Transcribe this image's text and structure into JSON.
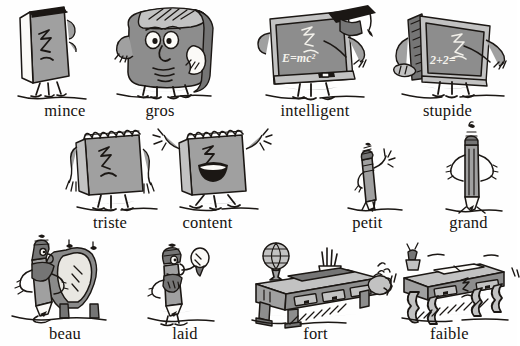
{
  "page": {
    "language": "fr",
    "background_color": "#ffffff",
    "ink_color": "#1b1714",
    "shade_color": "#a0a0a0",
    "rows": 3,
    "columns": 4
  },
  "items": [
    {
      "id": "mince",
      "label": "mince",
      "subject": "book-thin",
      "row": 1,
      "col": 1,
      "x": 0,
      "y": 0,
      "w": 130,
      "h": 120,
      "label_x": 46,
      "label_y": 101,
      "art_x": 12,
      "art_y": 4,
      "art_w": 72,
      "art_h": 92
    },
    {
      "id": "gros",
      "label": "gros",
      "subject": "book-fat",
      "row": 1,
      "col": 2,
      "x": 95,
      "y": 0,
      "w": 130,
      "h": 120,
      "label_x": 71,
      "label_y": 101,
      "art_x": 10,
      "art_y": 2,
      "art_w": 112,
      "art_h": 94
    },
    {
      "id": "intelligent",
      "label": "intelligent",
      "subject": "blackboard-smart",
      "board_text": "E=mc²",
      "row": 1,
      "col": 3,
      "x": 250,
      "y": 0,
      "w": 130,
      "h": 120,
      "label_x": 63,
      "label_y": 101,
      "art_x": 6,
      "art_y": 3,
      "art_w": 118,
      "art_h": 94
    },
    {
      "id": "stupide",
      "label": "stupide",
      "subject": "blackboard-dumb",
      "board_text": "2+2=",
      "row": 1,
      "col": 4,
      "x": 378,
      "y": 0,
      "w": 139,
      "h": 120,
      "label_x": 74,
      "label_y": 101,
      "art_x": 4,
      "art_y": 4,
      "art_w": 122,
      "art_h": 92
    },
    {
      "id": "triste",
      "label": "triste",
      "subject": "notepad-sad",
      "row": 2,
      "col": 1,
      "x": 45,
      "y": 118,
      "w": 130,
      "h": 115,
      "label_x": 48,
      "label_y": 95,
      "art_x": 14,
      "art_y": 3,
      "art_w": 98,
      "art_h": 90
    },
    {
      "id": "content",
      "label": "content",
      "subject": "notepad-happy",
      "row": 2,
      "col": 2,
      "x": 140,
      "y": 118,
      "w": 135,
      "h": 115,
      "label_x": 68,
      "label_y": 95,
      "art_x": 10,
      "art_y": 3,
      "art_w": 112,
      "art_h": 90
    },
    {
      "id": "petit",
      "label": "petit",
      "subject": "pencil-short",
      "row": 2,
      "col": 3,
      "x": 320,
      "y": 118,
      "w": 95,
      "h": 115,
      "label_x": 53,
      "label_y": 95,
      "art_x": 24,
      "art_y": 24,
      "art_w": 58,
      "art_h": 70
    },
    {
      "id": "grand",
      "label": "grand",
      "subject": "pencil-tall",
      "row": 2,
      "col": 4,
      "x": 420,
      "y": 118,
      "w": 97,
      "h": 115,
      "label_x": 53,
      "label_y": 95,
      "art_x": 18,
      "art_y": 3,
      "art_w": 66,
      "art_h": 92
    },
    {
      "id": "beau",
      "label": "beau",
      "subject": "pen-handsome-mirror",
      "row": 3,
      "col": 1,
      "x": 0,
      "y": 232,
      "w": 130,
      "h": 114,
      "label_x": 60,
      "label_y": 92,
      "art_x": 10,
      "art_y": 2,
      "art_w": 94,
      "art_h": 88
    },
    {
      "id": "laid",
      "label": "laid",
      "subject": "pen-ugly-mirror",
      "row": 3,
      "col": 2,
      "x": 120,
      "y": 232,
      "w": 130,
      "h": 114,
      "label_x": 56,
      "label_y": 92,
      "art_x": 24,
      "art_y": 10,
      "art_w": 68,
      "art_h": 80
    },
    {
      "id": "fort",
      "label": "fort",
      "subject": "desk-strong",
      "row": 3,
      "col": 3,
      "x": 248,
      "y": 232,
      "w": 135,
      "h": 114,
      "label_x": 62,
      "label_y": 92,
      "art_x": 4,
      "art_y": 8,
      "art_w": 128,
      "art_h": 82
    },
    {
      "id": "faible",
      "label": "faible",
      "subject": "desk-weak",
      "row": 3,
      "col": 4,
      "x": 382,
      "y": 232,
      "w": 135,
      "h": 114,
      "label_x": 62,
      "label_y": 92,
      "art_x": 6,
      "art_y": 8,
      "art_w": 126,
      "art_h": 82
    }
  ]
}
